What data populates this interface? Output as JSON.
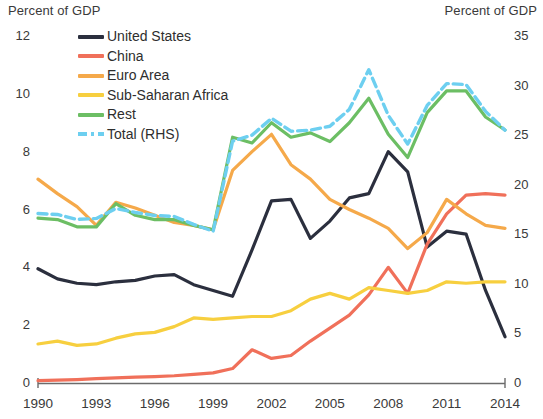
{
  "axis_titles": {
    "left": "Percent of GDP",
    "right": "Percent of GDP"
  },
  "legend": {
    "items": [
      {
        "label": "United States",
        "color": "#2b2f3e",
        "style": "solid"
      },
      {
        "label": "China",
        "color": "#f0705a",
        "style": "solid"
      },
      {
        "label": "Euro Area",
        "color": "#f5a94a",
        "style": "solid"
      },
      {
        "label": "Sub-Saharan Africa",
        "color": "#f7cf3f",
        "style": "solid"
      },
      {
        "label": "Rest",
        "color": "#6cbe64",
        "style": "solid"
      },
      {
        "label": "Total (RHS)",
        "color": "#6dcff0",
        "style": "dashed"
      }
    ]
  },
  "chart_data": {
    "type": "line",
    "title": "",
    "xlabel": "",
    "ylabel": "Percent of GDP",
    "y2label": "Percent of GDP",
    "grid": false,
    "legend_position": "top-left",
    "x": [
      1990,
      1991,
      1992,
      1993,
      1994,
      1995,
      1996,
      1997,
      1998,
      1999,
      2000,
      2001,
      2002,
      2003,
      2004,
      2005,
      2006,
      2007,
      2008,
      2009,
      2010,
      2011,
      2012,
      2013,
      2014
    ],
    "xticks": [
      1990,
      1993,
      1996,
      1999,
      2002,
      2005,
      2008,
      2011,
      2014
    ],
    "xlim": [
      1990,
      2014
    ],
    "ylim": [
      0,
      12
    ],
    "yticks": [
      0,
      2,
      4,
      6,
      8,
      10,
      12
    ],
    "y2lim": [
      0,
      35
    ],
    "y2ticks": [
      0,
      5,
      10,
      15,
      20,
      25,
      30,
      35
    ],
    "series": [
      {
        "name": "United States",
        "axis": "left",
        "color": "#2b2f3e",
        "style": "solid",
        "values": [
          3.95,
          3.6,
          3.45,
          3.4,
          3.5,
          3.55,
          3.7,
          3.75,
          3.4,
          3.2,
          3.0,
          4.6,
          6.3,
          6.35,
          5.0,
          5.6,
          6.4,
          6.55,
          8.0,
          7.3,
          4.7,
          5.25,
          5.15,
          3.2,
          1.6
        ]
      },
      {
        "name": "China",
        "axis": "left",
        "color": "#f0705a",
        "style": "solid",
        "values": [
          0.08,
          0.1,
          0.12,
          0.15,
          0.18,
          0.2,
          0.22,
          0.25,
          0.3,
          0.35,
          0.5,
          1.15,
          0.85,
          0.95,
          1.45,
          1.9,
          2.35,
          3.05,
          4.0,
          3.1,
          4.8,
          5.85,
          6.5,
          6.55,
          6.5
        ]
      },
      {
        "name": "Euro Area",
        "axis": "left",
        "color": "#f5a94a",
        "style": "solid",
        "values": [
          7.05,
          6.55,
          6.1,
          5.45,
          6.25,
          6.05,
          5.8,
          5.55,
          5.45,
          5.3,
          7.35,
          8.0,
          8.6,
          7.55,
          7.05,
          6.35,
          6.0,
          5.7,
          5.35,
          4.65,
          5.2,
          6.35,
          5.85,
          5.45,
          5.35
        ]
      },
      {
        "name": "Sub-Saharan Africa",
        "axis": "left",
        "color": "#f7cf3f",
        "style": "solid",
        "values": [
          1.35,
          1.45,
          1.3,
          1.35,
          1.55,
          1.7,
          1.75,
          1.95,
          2.25,
          2.2,
          2.25,
          2.3,
          2.3,
          2.5,
          2.9,
          3.1,
          2.9,
          3.3,
          3.2,
          3.1,
          3.2,
          3.5,
          3.45,
          3.5,
          3.5
        ]
      },
      {
        "name": "Rest",
        "axis": "left",
        "color": "#6cbe64",
        "style": "solid",
        "values": [
          5.7,
          5.65,
          5.4,
          5.4,
          6.2,
          5.8,
          5.65,
          5.65,
          5.45,
          5.3,
          8.5,
          8.3,
          9.0,
          8.5,
          8.65,
          8.35,
          9.0,
          9.85,
          8.6,
          7.8,
          9.35,
          10.1,
          10.1,
          9.2,
          8.75
        ]
      },
      {
        "name": "Total (RHS)",
        "axis": "right",
        "color": "#6dcff0",
        "style": "dashed",
        "values": [
          17.1,
          17.0,
          16.5,
          16.6,
          17.6,
          17.2,
          16.9,
          16.8,
          16.0,
          15.3,
          24.4,
          25.0,
          26.7,
          25.4,
          25.5,
          25.9,
          27.6,
          31.6,
          27.0,
          24.1,
          28.0,
          30.2,
          30.1,
          27.4,
          25.5
        ]
      }
    ]
  }
}
